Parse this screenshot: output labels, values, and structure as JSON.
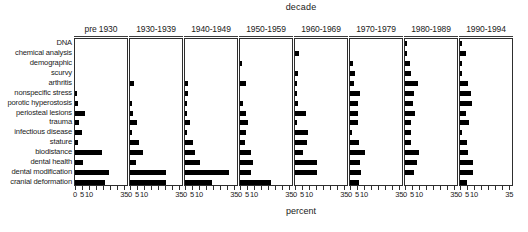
{
  "chart_data": {
    "type": "bar",
    "title": "decade",
    "xlabel": "percent",
    "ylabel": "",
    "orientation": "horizontal",
    "layout": "small-multiples",
    "grid": false,
    "legend": "none",
    "xlim": [
      0,
      37
    ],
    "xticks": [
      0,
      5,
      10,
      15,
      20,
      25,
      30,
      35
    ],
    "xtick_labels": [
      "0",
      "5",
      "10",
      "",
      "",
      "",
      "",
      "35"
    ],
    "panel_variable": "decade",
    "categories": [
      "DNA",
      "chemical analysis",
      "demographic",
      "scurvy",
      "arthritis",
      "nonspecific stress",
      "porotic hyperostosis",
      "periosteal lesions",
      "trauma",
      "infectious disease",
      "stature",
      "biodistance",
      "dental health",
      "dental modification",
      "cranial deformation"
    ],
    "panels": [
      {
        "label": "pre 1930",
        "values": [
          0,
          0,
          0,
          0,
          0,
          1.2,
          2.2,
          7.0,
          2.5,
          5.0,
          1.8,
          19.5,
          5.5,
          24.0,
          21.5
        ]
      },
      {
        "label": "1930-1939",
        "values": [
          0,
          0,
          0,
          0,
          3.0,
          0,
          1.5,
          1.8,
          5.0,
          1.5,
          6.5,
          9.5,
          4.5,
          25.5,
          25.5
        ]
      },
      {
        "label": "1940-1949",
        "values": [
          0,
          0,
          0,
          0,
          1.8,
          1.8,
          1.5,
          1.5,
          3.5,
          1.5,
          5.5,
          7.0,
          11.0,
          31.0,
          19.0
        ]
      },
      {
        "label": "1950-1959",
        "values": [
          0,
          0,
          1.2,
          0,
          4.5,
          0,
          2.0,
          4.5,
          5.5,
          4.5,
          3.5,
          8.0,
          9.5,
          7.5,
          22.0,
          17.0
        ]
      },
      {
        "label": "1960-1969",
        "values": [
          0,
          2.5,
          0,
          2.2,
          1.2,
          1.5,
          1.8,
          7.5,
          1.2,
          9.5,
          8.5,
          5.5,
          15.5,
          15.5,
          0
        ]
      },
      {
        "label": "1970-1979",
        "values": [
          0,
          0,
          2.0,
          3.5,
          2.8,
          7.0,
          5.5,
          6.0,
          5.5,
          1.5,
          6.5,
          10.5,
          7.0,
          8.0,
          6.5
        ]
      },
      {
        "label": "1980-1989",
        "values": [
          0.8,
          1.2,
          3.5,
          4.0,
          9.0,
          6.5,
          5.5,
          7.0,
          4.0,
          4.0,
          4.5,
          10.0,
          8.5,
          6.5,
          0
        ]
      },
      {
        "label": "1990-1994",
        "values": [
          1.0,
          4.0,
          1.5,
          1.0,
          5.5,
          8.0,
          8.5,
          4.5,
          6.5,
          1.5,
          5.0,
          6.0,
          9.5,
          9.0,
          5.0
        ]
      }
    ]
  }
}
